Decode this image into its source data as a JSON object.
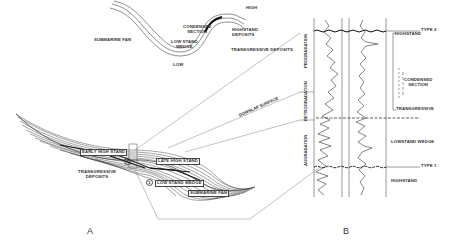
{
  "inset_curve": {
    "labels": {
      "high": "HIGH",
      "low": "LOW",
      "submarine_fan": "SUBMARINE FAN",
      "condensed_section": "CONDENSED\nSECTION",
      "lowstand_wedge": "LOW STAND\nWEDGE",
      "highstand_deposits": "HIGHSTAND\nDEPOSITS",
      "transgressive_deposits": "TRANSGRESSIVE DEPOSITS"
    }
  },
  "panel_a": {
    "label": "A",
    "units": {
      "early_high_stand": "EARLY HIGH STAND",
      "late_high_stand": "LATE HIGH STAND",
      "transgressive_deposits": "TRANSGRESSIVE\nDEPOSITS",
      "low_stand_wedge": "LOW STAND WEDGE",
      "submarine_fan": "SUBMARINE FAN",
      "marker_1": "1",
      "marker_2": "2"
    },
    "surface_label": "DOWNLAP SURFACE"
  },
  "panel_b": {
    "label": "B",
    "stacking_patterns": [
      "PROGRADATION",
      "RETROGRADATION",
      "AGGRADATION"
    ],
    "boundaries": {
      "top": "TYPE 2",
      "bottom": "TYPE 1"
    },
    "systems_tracts": {
      "highstand_top": "HIGHSTAND",
      "condensed_section": "CONDENSED\nSECTION",
      "transgressive": "TRANSGRESSIVE",
      "lowstand_wedge": "LOWSTAND WEDGE",
      "highstand_bottom": "HIGHSTAND"
    }
  },
  "colors": {
    "line": "#333333",
    "background": "#ffffff"
  }
}
